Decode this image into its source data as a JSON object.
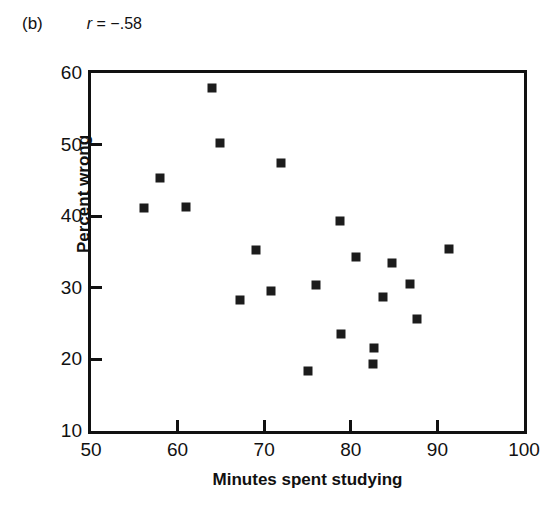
{
  "figure": {
    "panel_label": "(b)",
    "correlation_symbol": "r",
    "correlation_text": " = −.58"
  },
  "chart_data": {
    "type": "scatter",
    "title": "",
    "subtitle": "",
    "xlabel": "Minutes spent studying",
    "ylabel": "Percent wrong",
    "xlim": [
      50,
      100
    ],
    "ylim": [
      10,
      60
    ],
    "xticks": [
      50,
      60,
      70,
      80,
      90,
      100
    ],
    "yticks": [
      10,
      20,
      30,
      40,
      50,
      60
    ],
    "xtick_labels": [
      "50",
      "60",
      "70",
      "80",
      "90",
      "100"
    ],
    "ytick_labels": [
      "10",
      "20",
      "30",
      "40",
      "50",
      "60"
    ],
    "grid": false,
    "legend": null,
    "marker": "square",
    "marker_color": "#1c1c1c",
    "annotations": [
      {
        "text": "(b)",
        "position": "top-left"
      },
      {
        "text": "r = −.58",
        "position": "top-left"
      }
    ],
    "n_points": 20,
    "points": [
      {
        "x": 56.1,
        "y": 41.2
      },
      {
        "x": 58.0,
        "y": 45.3
      },
      {
        "x": 61.0,
        "y": 41.3
      },
      {
        "x": 64.0,
        "y": 57.9
      },
      {
        "x": 64.9,
        "y": 50.2
      },
      {
        "x": 67.2,
        "y": 28.3
      },
      {
        "x": 69.0,
        "y": 35.3
      },
      {
        "x": 70.8,
        "y": 29.5
      },
      {
        "x": 71.9,
        "y": 47.5
      },
      {
        "x": 75.1,
        "y": 18.4
      },
      {
        "x": 76.0,
        "y": 30.4
      },
      {
        "x": 78.8,
        "y": 39.3
      },
      {
        "x": 78.9,
        "y": 23.6
      },
      {
        "x": 80.6,
        "y": 34.3
      },
      {
        "x": 82.6,
        "y": 19.4
      },
      {
        "x": 82.7,
        "y": 21.6
      },
      {
        "x": 83.7,
        "y": 28.7
      },
      {
        "x": 84.7,
        "y": 33.4
      },
      {
        "x": 86.8,
        "y": 30.5
      },
      {
        "x": 87.6,
        "y": 25.7
      },
      {
        "x": 91.3,
        "y": 35.4
      }
    ]
  }
}
